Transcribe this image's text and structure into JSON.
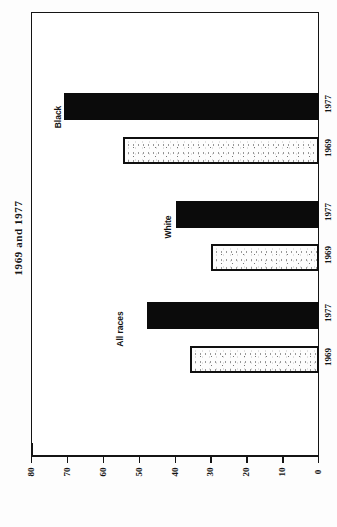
{
  "chart_data": {
    "type": "bar",
    "orientation": "horizontal",
    "title": "1969 and 1977",
    "xlabel": "",
    "ylabel": "",
    "grid": false,
    "legend": "none",
    "categories": [
      "All races",
      "White",
      "Black"
    ],
    "series": [
      {
        "name": "1969",
        "values": [
          36,
          30,
          54.5
        ],
        "style": "stippled-outline"
      },
      {
        "name": "1977",
        "values": [
          48,
          40,
          71
        ],
        "style": "solid-black"
      }
    ],
    "value_axis": {
      "min": 0,
      "max": 80,
      "tick_step": 10,
      "ticks": [
        "80",
        "70",
        "60",
        "50",
        "40",
        "30",
        "20",
        "10",
        "0"
      ],
      "direction": "descending-left-to-right"
    },
    "bars": [
      {
        "group": "Black",
        "year": "1977",
        "value": 71,
        "fill": "solid"
      },
      {
        "group": "Black",
        "year": "1969",
        "value": 54.5,
        "fill": "stipple"
      },
      {
        "group": "White",
        "year": "1977",
        "value": 40,
        "fill": "solid"
      },
      {
        "group": "White",
        "year": "1969",
        "value": 30,
        "fill": "stipple"
      },
      {
        "group": "All races",
        "year": "1977",
        "value": 48,
        "fill": "solid"
      },
      {
        "group": "All races",
        "year": "1969",
        "value": 36,
        "fill": "stipple"
      }
    ],
    "colors": {
      "solid_bar": "#0b0b0b",
      "stipple_bar_fill": "#fdfdfd",
      "outline": "#141414",
      "background": "#ffffff"
    }
  },
  "labels": {
    "title": "1969 and 1977",
    "groups": {
      "all_races": "All races",
      "white": "White",
      "black": "Black"
    },
    "years": {
      "y1969": "1969",
      "y1977": "1977"
    },
    "ticks": {
      "t80": "80",
      "t70": "70",
      "t60": "60",
      "t50": "50",
      "t40": "40",
      "t30": "30",
      "t20": "20",
      "t10": "10",
      "t0": "0"
    }
  }
}
